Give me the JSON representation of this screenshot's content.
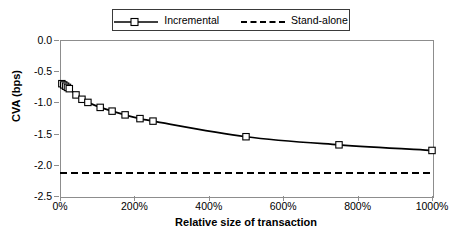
{
  "chart_data": {
    "type": "line",
    "title": "",
    "xlabel": "Relative size of transaction",
    "ylabel": "CVA (bps)",
    "xlim": [
      0,
      1000
    ],
    "ylim": [
      -2.5,
      0.0
    ],
    "xtick_labels": [
      "0%",
      "200%",
      "400%",
      "600%",
      "800%",
      "1000%"
    ],
    "xtick_values": [
      0,
      200,
      400,
      600,
      800,
      1000
    ],
    "ytick_labels": [
      "0.0",
      "-0.5",
      "-1.0",
      "-1.5",
      "-2.0",
      "-2.5"
    ],
    "ytick_values": [
      0.0,
      -0.5,
      -1.0,
      -1.5,
      -2.0,
      -2.5
    ],
    "grid": false,
    "legend_position": "top-center",
    "series": [
      {
        "name": "Incremental",
        "style": "solid",
        "marker": "square-open",
        "color": "#000000",
        "x": [
          5,
          10,
          15,
          20,
          25,
          43,
          59,
          75,
          108,
          140,
          175,
          215,
          250,
          500,
          750,
          1000
        ],
        "values": [
          -0.7,
          -0.72,
          -0.74,
          -0.76,
          -0.78,
          -0.88,
          -0.95,
          -1.0,
          -1.08,
          -1.14,
          -1.2,
          -1.26,
          -1.3,
          -1.55,
          -1.68,
          -1.77
        ]
      },
      {
        "name": "Stand-alone",
        "style": "dashed",
        "marker": "none",
        "color": "#000000",
        "x": [
          0,
          1000
        ],
        "values": [
          -2.13,
          -2.13
        ]
      }
    ]
  }
}
